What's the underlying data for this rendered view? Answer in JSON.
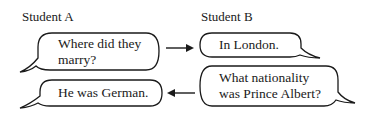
{
  "student_a": {
    "label": "Student A",
    "bubbles": [
      {
        "line1": "Where did they",
        "line2": "marry?"
      },
      {
        "line1": "He was German."
      }
    ]
  },
  "student_b": {
    "label": "Student B",
    "bubbles": [
      {
        "line1": "In London."
      },
      {
        "line1": "What nationality",
        "line2": "was Prince Albert?"
      }
    ]
  },
  "arrows": [
    {
      "direction": "right",
      "from": "student_a.bubbles.0",
      "to": "student_b.bubbles.0"
    },
    {
      "direction": "left",
      "from": "student_b.bubbles.1",
      "to": "student_a.bubbles.1"
    }
  ],
  "colors": {
    "stroke": "#1a1a1a",
    "background": "#ffffff"
  }
}
